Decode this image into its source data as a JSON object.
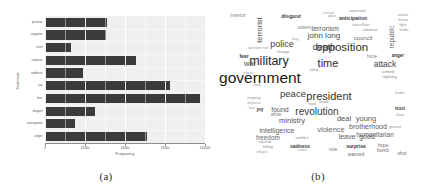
{
  "figure": {
    "panel_a_caption": "(a)",
    "panel_b_caption": "(b)"
  },
  "chart_data": [
    {
      "type": "bar",
      "orientation": "horizontal",
      "title": "",
      "xlabel": "Frequency",
      "ylabel": "Sentiment",
      "categories": [
        "anger",
        "anticipation",
        "disgust",
        "fear",
        "joy",
        "sadness",
        "surprise",
        "trust",
        "negative",
        "positive"
      ],
      "values": [
        64,
        19,
        31,
        97,
        78,
        24,
        57,
        16,
        38,
        39
      ],
      "xlim": [
        0,
        100
      ],
      "xticks": [
        0,
        25,
        50,
        75,
        100
      ],
      "xticklabels": [
        "0",
        "25000",
        "50000",
        "75000",
        "100000"
      ],
      "grid": true,
      "bar_color": "#3b3b3b",
      "panel_color": "#efefef"
    },
    {
      "type": "wordcloud",
      "title": "",
      "words": [
        {
          "text": "government",
          "size": 15.5,
          "weight": 1.0,
          "color": "#1a1a1a",
          "x": 40,
          "y": 74,
          "bold": false
        },
        {
          "text": "military",
          "size": 12.5,
          "weight": 0.85,
          "color": "#262626",
          "x": 49,
          "y": 57,
          "bold": false
        },
        {
          "text": "opposition",
          "size": 11.5,
          "weight": 0.82,
          "color": "#2e2e2e",
          "x": 122,
          "y": 44,
          "bold": false
        },
        {
          "text": "president",
          "size": 11.0,
          "weight": 0.78,
          "color": "#333333",
          "x": 109,
          "y": 92,
          "bold": false
        },
        {
          "text": "time",
          "size": 11.0,
          "weight": 0.78,
          "color": "#2b2b2b",
          "x": 108,
          "y": 59,
          "bold": false
        },
        {
          "text": "revolution",
          "size": 10.0,
          "weight": 0.72,
          "color": "#3a3a3a",
          "x": 97,
          "y": 108,
          "bold": false
        },
        {
          "text": "peace",
          "size": 9.5,
          "weight": 0.7,
          "color": "#3a3a3a",
          "x": 73,
          "y": 90,
          "bold": false
        },
        {
          "text": "death",
          "size": 9.0,
          "weight": 0.67,
          "color": "#3d3d3d",
          "x": 104,
          "y": 43,
          "bold": false
        },
        {
          "text": "police",
          "size": 9.0,
          "weight": 0.67,
          "color": "#3d3d3d",
          "x": 62,
          "y": 40,
          "bold": false
        },
        {
          "text": "attack",
          "size": 8.5,
          "weight": 0.63,
          "color": "#454545",
          "x": 165,
          "y": 60,
          "bold": false
        },
        {
          "text": "john long",
          "size": 8.0,
          "weight": 0.6,
          "color": "#4a4a4a",
          "x": 104,
          "y": 32,
          "bold": false
        },
        {
          "text": "brotherhood",
          "size": 7.0,
          "weight": 0.55,
          "color": "#5a5a5a",
          "x": 148,
          "y": 122,
          "bold": false
        },
        {
          "text": "humanitarian",
          "size": 6.5,
          "weight": 0.52,
          "color": "#5e5e5e",
          "x": 155,
          "y": 131,
          "bold": false
        },
        {
          "text": "ministry",
          "size": 7.5,
          "weight": 0.56,
          "color": "#565656",
          "x": 72,
          "y": 117,
          "bold": false
        },
        {
          "text": "intelligence",
          "size": 7.0,
          "weight": 0.54,
          "color": "#636363",
          "x": 57,
          "y": 126,
          "bold": false
        },
        {
          "text": "violence",
          "size": 7.5,
          "weight": 0.55,
          "color": "#6b6b6b",
          "x": 111,
          "y": 126,
          "bold": false
        },
        {
          "text": "terrorism",
          "size": 7.0,
          "weight": 0.54,
          "color": "#5a5a5a",
          "x": 105,
          "y": 24,
          "bold": false
        },
        {
          "text": "deal",
          "size": 7.5,
          "weight": 0.56,
          "color": "#555555",
          "x": 124,
          "y": 115,
          "bold": false
        },
        {
          "text": "young",
          "size": 7.5,
          "weight": 0.56,
          "color": "#5a5a5a",
          "x": 146,
          "y": 115,
          "bold": false
        },
        {
          "text": "leave",
          "size": 7.0,
          "weight": 0.54,
          "color": "#5c5c5c",
          "x": 127,
          "y": 132,
          "bold": false
        },
        {
          "text": "good",
          "size": 7.0,
          "weight": 0.54,
          "color": "#5c5c5c",
          "x": 147,
          "y": 132,
          "bold": false
        },
        {
          "text": "freedom",
          "size": 6.5,
          "weight": 0.5,
          "color": "#6a6a6a",
          "x": 48,
          "y": 134,
          "bold": false
        },
        {
          "text": "war",
          "size": 7.5,
          "weight": 0.58,
          "color": "#4e4e4e",
          "x": 30,
          "y": 60,
          "bold": false
        },
        {
          "text": "found",
          "size": 7.0,
          "weight": 0.54,
          "color": "#575757",
          "x": 60,
          "y": 105,
          "bold": false
        },
        {
          "text": "council",
          "size": 6.0,
          "weight": 0.48,
          "color": "#6d6d6d",
          "x": 143,
          "y": 34,
          "bold": false
        },
        {
          "text": "terrorist",
          "size": 7.5,
          "weight": 0.56,
          "color": "#4e4e4e",
          "x": 40,
          "y": 26,
          "bold": false,
          "rotate": true
        },
        {
          "text": "republic",
          "size": 6.5,
          "weight": 0.5,
          "color": "#5e5e5e",
          "x": 172,
          "y": 33,
          "bold": false,
          "rotate": true
        },
        {
          "text": "interior",
          "size": 5.0,
          "weight": 0.42,
          "color": "#858585",
          "x": 18,
          "y": 11,
          "bold": false
        },
        {
          "text": "anticipation",
          "size": 5.0,
          "weight": 0.46,
          "color": "#3c3c3c",
          "x": 133,
          "y": 14,
          "bold": true
        },
        {
          "text": "disgust",
          "size": 5.5,
          "weight": 0.48,
          "color": "#3a3a3a",
          "x": 71,
          "y": 13,
          "bold": true
        },
        {
          "text": "fear",
          "size": 5.0,
          "weight": 0.46,
          "color": "#3a3a3a",
          "x": 24,
          "y": 52,
          "bold": true
        },
        {
          "text": "anger",
          "size": 4.5,
          "weight": 0.44,
          "color": "#3c3c3c",
          "x": 178,
          "y": 52,
          "bold": true
        },
        {
          "text": "trust",
          "size": 4.5,
          "weight": 0.44,
          "color": "#3c3c3c",
          "x": 180,
          "y": 105,
          "bold": true
        },
        {
          "text": "sadness",
          "size": 5.0,
          "weight": 0.46,
          "color": "#3a3a3a",
          "x": 80,
          "y": 142,
          "bold": true
        },
        {
          "text": "surprise",
          "size": 5.0,
          "weight": 0.46,
          "color": "#3a3a3a",
          "x": 136,
          "y": 142,
          "bold": true
        },
        {
          "text": "joy",
          "size": 4.5,
          "weight": 0.44,
          "color": "#3a3a3a",
          "x": 40,
          "y": 106,
          "bold": true
        },
        {
          "text": "expected",
          "size": 4.0,
          "weight": 0.36,
          "color": "#8a8a8a",
          "x": 137,
          "y": 7,
          "bold": false
        },
        {
          "text": "violent",
          "size": 4.5,
          "weight": 0.4,
          "color": "#7b7b7b",
          "x": 84,
          "y": 24,
          "bold": false
        },
        {
          "text": "change",
          "size": 4.0,
          "weight": 0.36,
          "color": "#888888",
          "x": 63,
          "y": 48,
          "bold": false
        },
        {
          "text": "continue",
          "size": 4.0,
          "weight": 0.36,
          "color": "#858585",
          "x": 150,
          "y": 26,
          "bold": false
        },
        {
          "text": "sourcStart",
          "size": 3.8,
          "weight": 0.34,
          "color": "#8e8e8e",
          "x": 141,
          "y": 22,
          "bold": false
        },
        {
          "text": "white",
          "size": 4.5,
          "weight": 0.4,
          "color": "#7d7d7d",
          "x": 56,
          "y": 111,
          "bold": false
        },
        {
          "text": "conflict",
          "size": 4.2,
          "weight": 0.38,
          "color": "#858585",
          "x": 82,
          "y": 134,
          "bold": false
        },
        {
          "text": "vote",
          "size": 4.5,
          "weight": 0.4,
          "color": "#7a7a7a",
          "x": 113,
          "y": 146,
          "bold": false
        },
        {
          "text": "warned",
          "size": 5.0,
          "weight": 0.42,
          "color": "#6e6e6e",
          "x": 136,
          "y": 150,
          "bold": false
        },
        {
          "text": "bomb",
          "size": 4.8,
          "weight": 0.42,
          "color": "#707070",
          "x": 163,
          "y": 147,
          "bold": false
        },
        {
          "text": "shot",
          "size": 4.8,
          "weight": 0.42,
          "color": "#707070",
          "x": 182,
          "y": 150,
          "bold": false
        },
        {
          "text": "hope",
          "size": 4.8,
          "weight": 0.42,
          "color": "#747474",
          "x": 163,
          "y": 142,
          "bold": false
        },
        {
          "text": "killing",
          "size": 4.0,
          "weight": 0.36,
          "color": "#8a8a8a",
          "x": 48,
          "y": 143,
          "bold": false
        },
        {
          "text": "injured",
          "size": 4.0,
          "weight": 0.36,
          "color": "#8a8a8a",
          "x": 45,
          "y": 138,
          "bold": false
        },
        {
          "text": "crisis",
          "size": 3.8,
          "weight": 0.34,
          "color": "#909090",
          "x": 82,
          "y": 147,
          "bold": false
        },
        {
          "text": "force",
          "size": 4.5,
          "weight": 0.4,
          "color": "#7c7c7c",
          "x": 152,
          "y": 53,
          "bold": false
        },
        {
          "text": "armed",
          "size": 4.2,
          "weight": 0.38,
          "color": "#828282",
          "x": 168,
          "y": 68,
          "bold": false
        },
        {
          "text": "fighting",
          "size": 4.2,
          "weight": 0.38,
          "color": "#828282",
          "x": 170,
          "y": 73,
          "bold": false
        },
        {
          "text": "rocket",
          "size": 3.8,
          "weight": 0.34,
          "color": "#8e8e8e",
          "x": 183,
          "y": 12,
          "bold": false
        },
        {
          "text": "threat",
          "size": 3.8,
          "weight": 0.34,
          "color": "#8e8e8e",
          "x": 183,
          "y": 17,
          "bold": false
        },
        {
          "text": "fight",
          "size": 3.8,
          "weight": 0.34,
          "color": "#8e8e8e",
          "x": 183,
          "y": 22,
          "bold": false
        },
        {
          "text": "strike",
          "size": 3.8,
          "weight": 0.34,
          "color": "#8e8e8e",
          "x": 184,
          "y": 27,
          "bold": false
        },
        {
          "text": "majority",
          "size": 3.8,
          "weight": 0.34,
          "color": "#8e8e8e",
          "x": 34,
          "y": 95,
          "bold": false
        },
        {
          "text": "physical",
          "size": 3.6,
          "weight": 0.32,
          "color": "#939393",
          "x": 34,
          "y": 100,
          "bold": false
        },
        {
          "text": "hair",
          "size": 3.6,
          "weight": 0.32,
          "color": "#939393",
          "x": 32,
          "y": 105,
          "bold": false
        },
        {
          "text": "operation rule",
          "size": 3.4,
          "weight": 0.3,
          "color": "#989898",
          "x": 38,
          "y": 45,
          "bold": false
        },
        {
          "text": "general",
          "size": 3.6,
          "weight": 0.32,
          "color": "#939393",
          "x": 175,
          "y": 124,
          "bold": false
        },
        {
          "text": "show",
          "size": 3.6,
          "weight": 0.32,
          "color": "#939393",
          "x": 180,
          "y": 112,
          "bold": false
        },
        {
          "text": "leader",
          "size": 3.6,
          "weight": 0.32,
          "color": "#939393",
          "x": 180,
          "y": 90,
          "bold": false
        },
        {
          "text": "food",
          "size": 3.8,
          "weight": 0.34,
          "color": "#8e8e8e",
          "x": 92,
          "y": 101,
          "bold": false
        },
        {
          "text": "break",
          "size": 3.8,
          "weight": 0.34,
          "color": "#8e8e8e",
          "x": 104,
          "y": 99,
          "bold": false
        },
        {
          "text": "land",
          "size": 3.6,
          "weight": 0.32,
          "color": "#939393",
          "x": 37,
          "y": 82,
          "bold": false
        },
        {
          "text": "killed",
          "size": 3.6,
          "weight": 0.32,
          "color": "#939393",
          "x": 94,
          "y": 67,
          "bold": false
        },
        {
          "text": "attend",
          "size": 3.4,
          "weight": 0.3,
          "color": "#989898",
          "x": 28,
          "y": 70,
          "bold": false
        },
        {
          "text": "king",
          "size": 3.4,
          "weight": 0.3,
          "color": "#989898",
          "x": 75,
          "y": 36,
          "bold": false
        },
        {
          "text": "criminal",
          "size": 3.4,
          "weight": 0.3,
          "color": "#989898",
          "x": 108,
          "y": 10,
          "bold": false
        },
        {
          "text": "plan",
          "size": 3.8,
          "weight": 0.34,
          "color": "#8e8e8e",
          "x": 112,
          "y": 13,
          "bold": false
        },
        {
          "text": "refugee",
          "size": 3.4,
          "weight": 0.3,
          "color": "#9a9a9a",
          "x": 42,
          "y": 149,
          "bold": false
        }
      ]
    }
  ]
}
